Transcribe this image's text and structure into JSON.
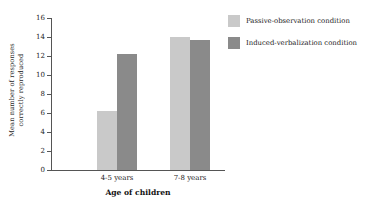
{
  "chart_data": {
    "type": "bar",
    "title": "",
    "xlabel": "Age of children",
    "ylabel_line1": "Mean number of responses",
    "ylabel_line2": "correctly reproduced",
    "categories": [
      "4-5 years",
      "7-8 years"
    ],
    "series": [
      {
        "name": "Passive-observation condition",
        "color": "#c9c9c9",
        "values": [
          6.2,
          14.0
        ]
      },
      {
        "name": "Induced-verbalization condition",
        "color": "#8a8a8a",
        "values": [
          12.2,
          13.7
        ]
      }
    ],
    "ylim": [
      0,
      16
    ],
    "ytick_step": 2,
    "yticks": [
      "0",
      "2",
      "4",
      "6",
      "8",
      "10",
      "12",
      "14",
      "16"
    ],
    "grid": false,
    "legend_position": "right"
  },
  "axes": {
    "axis_color": "#555555"
  }
}
